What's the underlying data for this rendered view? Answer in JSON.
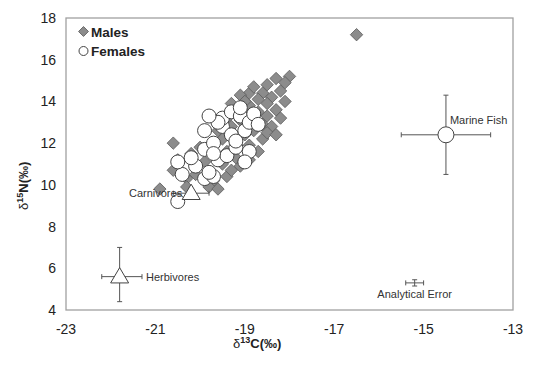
{
  "chart_data": {
    "type": "scatter",
    "title": "",
    "xlabel": "δ13C(‰)",
    "ylabel": "δ15N(‰)",
    "xlim": [
      -23,
      -13
    ],
    "ylim": [
      4,
      18
    ],
    "xticks": [
      -23,
      -21,
      -19,
      -17,
      -15,
      -13
    ],
    "yticks": [
      4,
      6,
      8,
      10,
      12,
      14,
      16,
      18
    ],
    "grid": false,
    "legend": {
      "position": "upper-left",
      "entries": [
        {
          "label": "Males",
          "marker": "diamond",
          "color": "#8c8c8c"
        },
        {
          "label": "Females",
          "marker": "circle",
          "color": "#ffffff"
        }
      ]
    },
    "series": [
      {
        "name": "Males",
        "marker": "diamond",
        "points": [
          [
            -16.5,
            17.2
          ],
          [
            -18.0,
            15.2
          ],
          [
            -18.3,
            15.1
          ],
          [
            -18.1,
            14.9
          ],
          [
            -18.5,
            14.8
          ],
          [
            -18.2,
            14.5
          ],
          [
            -18.6,
            14.4
          ],
          [
            -18.9,
            14.4
          ],
          [
            -18.4,
            14.2
          ],
          [
            -18.7,
            14.1
          ],
          [
            -18.1,
            14.0
          ],
          [
            -19.1,
            14.3
          ],
          [
            -18.5,
            13.9
          ],
          [
            -18.9,
            13.8
          ],
          [
            -19.3,
            13.9
          ],
          [
            -18.3,
            13.6
          ],
          [
            -18.7,
            13.5
          ],
          [
            -19.0,
            13.4
          ],
          [
            -18.5,
            13.3
          ],
          [
            -18.2,
            13.2
          ],
          [
            -18.9,
            13.1
          ],
          [
            -18.6,
            12.9
          ],
          [
            -19.3,
            12.8
          ],
          [
            -18.4,
            12.8
          ],
          [
            -18.8,
            12.6
          ],
          [
            -19.0,
            12.4
          ],
          [
            -18.6,
            12.2
          ],
          [
            -19.2,
            12.0
          ],
          [
            -19.5,
            12.2
          ],
          [
            -18.9,
            11.9
          ],
          [
            -19.4,
            11.6
          ],
          [
            -19.7,
            11.4
          ],
          [
            -19.2,
            11.3
          ],
          [
            -19.9,
            11.1
          ],
          [
            -19.5,
            11.0
          ],
          [
            -19.1,
            10.9
          ],
          [
            -19.8,
            10.6
          ],
          [
            -20.1,
            10.5
          ],
          [
            -19.4,
            10.4
          ],
          [
            -19.7,
            10.2
          ],
          [
            -20.3,
            10.3
          ],
          [
            -20.6,
            10.7
          ],
          [
            -20.5,
            11.2
          ],
          [
            -19.8,
            9.9
          ],
          [
            -20.3,
            9.9
          ],
          [
            -20.9,
            9.8
          ],
          [
            -19.6,
            9.8
          ],
          [
            -19.3,
            10.7
          ],
          [
            -18.9,
            11.2
          ],
          [
            -18.7,
            11.6
          ],
          [
            -18.5,
            12.5
          ],
          [
            -18.3,
            12.4
          ],
          [
            -19.1,
            13.1
          ],
          [
            -19.4,
            13.2
          ],
          [
            -19.6,
            12.6
          ],
          [
            -20.0,
            11.8
          ],
          [
            -20.2,
            11.5
          ],
          [
            -20.6,
            12.0
          ],
          [
            -19.0,
            14.0
          ],
          [
            -18.8,
            14.7
          ]
        ]
      },
      {
        "name": "Females",
        "marker": "circle",
        "points": [
          [
            -20.5,
            9.2
          ],
          [
            -20.4,
            10.5
          ],
          [
            -20.1,
            10.9
          ],
          [
            -20.2,
            11.3
          ],
          [
            -20.5,
            11.1
          ],
          [
            -19.9,
            10.3
          ],
          [
            -19.7,
            10.4
          ],
          [
            -19.8,
            10.6
          ],
          [
            -19.6,
            11.2
          ],
          [
            -19.9,
            11.7
          ],
          [
            -19.4,
            11.4
          ],
          [
            -19.2,
            11.8
          ],
          [
            -19.7,
            12.0
          ],
          [
            -19.9,
            12.6
          ],
          [
            -19.5,
            12.8
          ],
          [
            -19.3,
            12.4
          ],
          [
            -19.5,
            13.2
          ],
          [
            -19.3,
            13.5
          ],
          [
            -19.1,
            13.3
          ],
          [
            -19.6,
            13.0
          ],
          [
            -19.0,
            12.6
          ],
          [
            -18.9,
            13.0
          ],
          [
            -18.8,
            13.4
          ],
          [
            -19.1,
            13.7
          ],
          [
            -18.7,
            12.9
          ],
          [
            -19.2,
            12.1
          ],
          [
            -18.9,
            11.6
          ],
          [
            -19.0,
            11.1
          ],
          [
            -19.7,
            11.5
          ],
          [
            -19.8,
            13.3
          ]
        ]
      }
    ],
    "reference_points": [
      {
        "label": "Marine Fish",
        "marker": "circle-large",
        "x": -14.5,
        "y": 12.4,
        "x_err": [
          -15.5,
          -13.5
        ],
        "y_err": [
          10.5,
          14.3
        ]
      },
      {
        "label": "Carnivores",
        "marker": "triangle",
        "x": -20.2,
        "y": 9.6,
        "x_err": [
          -20.6,
          -19.8
        ],
        "y_err": [
          9.6,
          9.6
        ]
      },
      {
        "label": "Herbivores",
        "marker": "triangle",
        "x": -21.8,
        "y": 5.6,
        "x_err": [
          -22.2,
          -21.3
        ],
        "y_err": [
          4.4,
          7.0
        ]
      },
      {
        "label": "Analytical Error",
        "marker": "errorbar",
        "x": -15.2,
        "y": 5.3,
        "x_err": [
          -15.4,
          -15.0
        ],
        "y_err": [
          5.15,
          5.45
        ]
      }
    ]
  },
  "labels": {
    "legend_males": "Males",
    "legend_females": "Females",
    "x_title_prefix": "δ",
    "x_title_sup": "13",
    "x_title_suffix": "C(‰)",
    "y_title_prefix": "δ",
    "y_title_sup": "15",
    "y_title_suffix": "N(‰)"
  },
  "colors": {
    "male_fill": "#8c8c8c",
    "male_stroke": "#5a5a5a",
    "female_fill": "#ffffff",
    "female_stroke": "#444444",
    "axis": "#a0a0a0",
    "text": "#222222"
  }
}
